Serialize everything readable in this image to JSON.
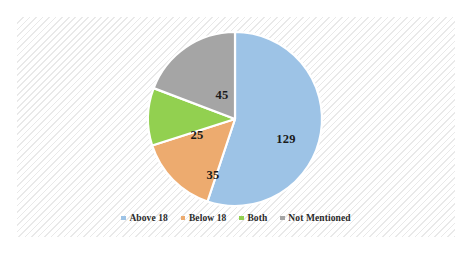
{
  "chart_data": {
    "type": "pie",
    "title": "",
    "subtitle": "",
    "xlabel": "",
    "ylabel": "",
    "grid": false,
    "legend_position": "bottom",
    "total": 234,
    "categories": [
      "Above 18",
      "Below 18",
      "Both",
      "Not Mentioned"
    ],
    "values": [
      129,
      35,
      25,
      45
    ],
    "colors": [
      "#9DC3E6",
      "#EDAB6F",
      "#92D050",
      "#A5A5A5"
    ],
    "slices": [
      {
        "label": "Above 18",
        "value": 129,
        "value_text": "129",
        "color": "#9DC3E6",
        "start_angle": 0,
        "sweep_angle": 198.46,
        "label_x": 269,
        "label_y": 122
      },
      {
        "label": "Below 18",
        "value": 35,
        "value_text": "35",
        "color": "#EDAB6F",
        "start_angle": 198.46,
        "sweep_angle": 53.85,
        "label_x": 196,
        "label_y": 158
      },
      {
        "label": "Both",
        "value": 25,
        "value_text": "25",
        "color": "#92D050",
        "start_angle": 252.31,
        "sweep_angle": 38.46,
        "label_x": 180,
        "label_y": 118
      },
      {
        "label": "Not Mentioned",
        "value": 45,
        "value_text": "45",
        "color": "#A5A5A5",
        "start_angle": 290.77,
        "sweep_angle": 69.23,
        "label_x": 205,
        "label_y": 78
      }
    ],
    "legend": [
      {
        "label": "Above 18",
        "color": "#9DC3E6"
      },
      {
        "label": "Below 18",
        "color": "#EDAB6F"
      },
      {
        "label": "Both",
        "color": "#92D050"
      },
      {
        "label": "Not Mentioned",
        "color": "#A5A5A5"
      }
    ]
  },
  "style": {
    "slice_border_color": "#ffffff",
    "panel_background": "#fdfdfd",
    "hatch_color": "#e9e9e9",
    "label_color": "#1a1a1a"
  },
  "geometry": {
    "center_x": 218,
    "center_y": 102,
    "radius": 87
  }
}
